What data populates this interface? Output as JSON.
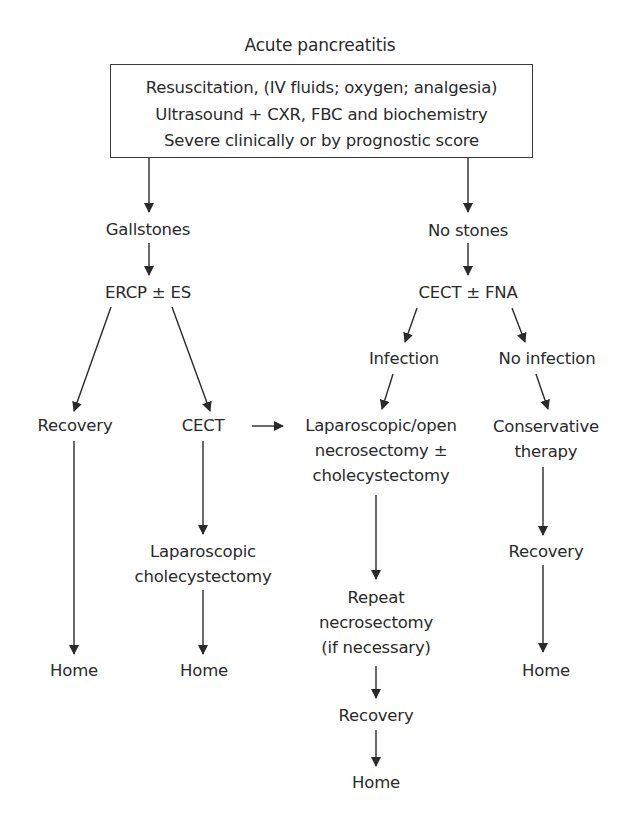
{
  "title": "Acute pancreatitis",
  "initial_box": {
    "lines": [
      "Resuscitation, (IV fluids; oxygen; analgesia)",
      "Ultrasound + CXR, FBC and biochemistry",
      "Severe clinically or by prognostic score"
    ]
  },
  "nodes": {
    "gallstones": "Gallstones",
    "no_stones": "No stones",
    "ercp": "ERCP ± ES",
    "cect_fna": "CECT ± FNA",
    "infection": "Infection",
    "no_infection": "No infection",
    "recovery_left": "Recovery",
    "cect": "CECT",
    "necrosectomy": [
      "Laparoscopic/open",
      "necrosectomy ±",
      "cholecystectomy"
    ],
    "conservative": [
      "Conservative",
      "therapy"
    ],
    "lap_chole": [
      "Laparoscopic",
      "cholecystectomy"
    ],
    "repeat": [
      "Repeat",
      "necrosectomy",
      "(if necessary)"
    ],
    "recovery_right": "Recovery",
    "home_left": "Home",
    "home_mid": "Home",
    "home_right": "Home",
    "recovery_mid": "Recovery",
    "home_bottom": "Home"
  },
  "edges": [
    [
      "initial_box",
      "gallstones"
    ],
    [
      "initial_box",
      "no_stones"
    ],
    [
      "gallstones",
      "ercp"
    ],
    [
      "no_stones",
      "cect_fna"
    ],
    [
      "ercp",
      "recovery_left"
    ],
    [
      "ercp",
      "cect"
    ],
    [
      "cect_fna",
      "infection"
    ],
    [
      "cect_fna",
      "no_infection"
    ],
    [
      "cect",
      "necrosectomy"
    ],
    [
      "infection",
      "necrosectomy"
    ],
    [
      "no_infection",
      "conservative"
    ],
    [
      "recovery_left",
      "home_left"
    ],
    [
      "cect",
      "lap_chole"
    ],
    [
      "lap_chole",
      "home_mid"
    ],
    [
      "necrosectomy",
      "repeat"
    ],
    [
      "conservative",
      "recovery_right"
    ],
    [
      "recovery_right",
      "home_right"
    ],
    [
      "repeat",
      "recovery_mid"
    ],
    [
      "recovery_mid",
      "home_bottom"
    ]
  ],
  "colors": {
    "line": "#2a2a2a",
    "text": "#2a2a2a",
    "background": "#ffffff"
  }
}
